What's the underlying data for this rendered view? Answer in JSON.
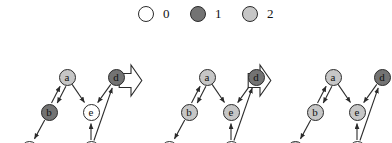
{
  "figure": {
    "type": "state-transition-graph-sequence",
    "background": "#ffffff",
    "line_color": "#2b2b2b"
  },
  "legend": {
    "title": "",
    "items": [
      {
        "label": "0",
        "color": "#ffffff",
        "icon": "circle-icon",
        "x": 138
      },
      {
        "label": "1",
        "color": "#737373",
        "icon": "circle-icon",
        "x": 190
      },
      {
        "label": "2",
        "color": "#c6c6c6",
        "icon": "circle-icon",
        "x": 242
      }
    ]
  },
  "colors": {
    "state0": "#ffffff",
    "state1": "#737373",
    "state2": "#c6c6c6",
    "stroke": "#2b2b2b"
  },
  "graph": {
    "nodes": [
      {
        "id": "a",
        "label": "a",
        "x": 67,
        "y": 49
      },
      {
        "id": "b",
        "label": "b",
        "x": 49,
        "y": 84
      },
      {
        "id": "c",
        "label": "c",
        "x": 29,
        "y": 121
      },
      {
        "id": "d",
        "label": "d",
        "x": 116,
        "y": 49
      },
      {
        "id": "e",
        "label": "e",
        "x": 91,
        "y": 84
      },
      {
        "id": "f",
        "label": "f",
        "x": 91,
        "y": 121
      }
    ],
    "edges": [
      {
        "from": "a",
        "to": "b",
        "note": "a-to-b"
      },
      {
        "from": "b",
        "to": "a",
        "note": "b-to-a"
      },
      {
        "from": "a",
        "to": "e",
        "note": "a-to-e"
      },
      {
        "from": "d",
        "to": "e",
        "note": "d-to-e"
      },
      {
        "from": "b",
        "to": "c",
        "note": "b-to-c"
      },
      {
        "from": "f",
        "to": "e",
        "note": "f-to-e"
      },
      {
        "from": "f",
        "to": "d",
        "note": "f-to-d"
      }
    ]
  },
  "panels": [
    {
      "name": "panel-1",
      "x": 0,
      "states": {
        "a": "2",
        "b": "1",
        "c": "0",
        "d": "1",
        "e": "0",
        "f": "0"
      }
    },
    {
      "name": "panel-2",
      "x": 140,
      "states": {
        "a": "2",
        "b": "2",
        "c": "0",
        "d": "1",
        "e": "2",
        "f": "0"
      }
    },
    {
      "name": "panel-3",
      "x": 266,
      "states": {
        "a": "2",
        "b": "2",
        "c": "2",
        "d": "1",
        "e": "2",
        "f": "0"
      }
    }
  ],
  "transitions": [
    {
      "name": "transition-arrow-1",
      "x": 118,
      "y": 63,
      "direction": "right"
    },
    {
      "name": "transition-arrow-2",
      "x": 247,
      "y": 63,
      "direction": "right"
    }
  ]
}
